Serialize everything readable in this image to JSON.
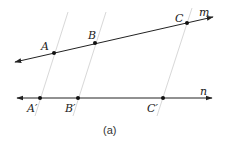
{
  "figure": {
    "caption": "(a)",
    "colors": {
      "line": "#222222",
      "transversal": "#d8d8d8",
      "point": "#111111",
      "background": "#ffffff"
    },
    "line_m": {
      "label": "m",
      "x1": 15,
      "y1": 62,
      "x2": 213,
      "y2": 17,
      "points": [
        {
          "label": "A",
          "x": 54,
          "y": 53,
          "lx": 41,
          "ly": 50
        },
        {
          "label": "B",
          "x": 95,
          "y": 43,
          "lx": 88,
          "ly": 39
        },
        {
          "label": "C",
          "x": 187,
          "y": 23,
          "lx": 175,
          "ly": 22
        }
      ]
    },
    "line_n": {
      "label": "n",
      "x1": 17,
      "y1": 98,
      "x2": 212,
      "y2": 98,
      "points": [
        {
          "label": "A′",
          "x": 40,
          "y": 98,
          "lx": 27,
          "ly": 112
        },
        {
          "label": "B′",
          "x": 78,
          "y": 98,
          "lx": 65,
          "ly": 112
        },
        {
          "label": "C′",
          "x": 163,
          "y": 98,
          "lx": 147,
          "ly": 112
        }
      ]
    },
    "transversals": [
      {
        "from": "A",
        "to": "A′",
        "x1": 68,
        "y1": 12,
        "x2": 35,
        "y2": 116
      },
      {
        "from": "B",
        "to": "B′",
        "x1": 106,
        "y1": 12,
        "x2": 73,
        "y2": 116
      },
      {
        "from": "C",
        "to": "C′",
        "x1": 192,
        "y1": 8,
        "x2": 157,
        "y2": 116
      }
    ]
  }
}
